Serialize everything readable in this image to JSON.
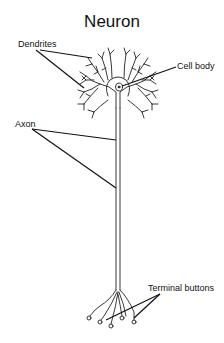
{
  "diagram": {
    "title": "Neuron",
    "labels": {
      "dendrites": "Dendrites",
      "cell_body": "Cell body",
      "axon": "Axon",
      "terminal_buttons": "Terminal buttons"
    },
    "colors": {
      "line": "#111111",
      "fill": "#ffffff"
    }
  }
}
